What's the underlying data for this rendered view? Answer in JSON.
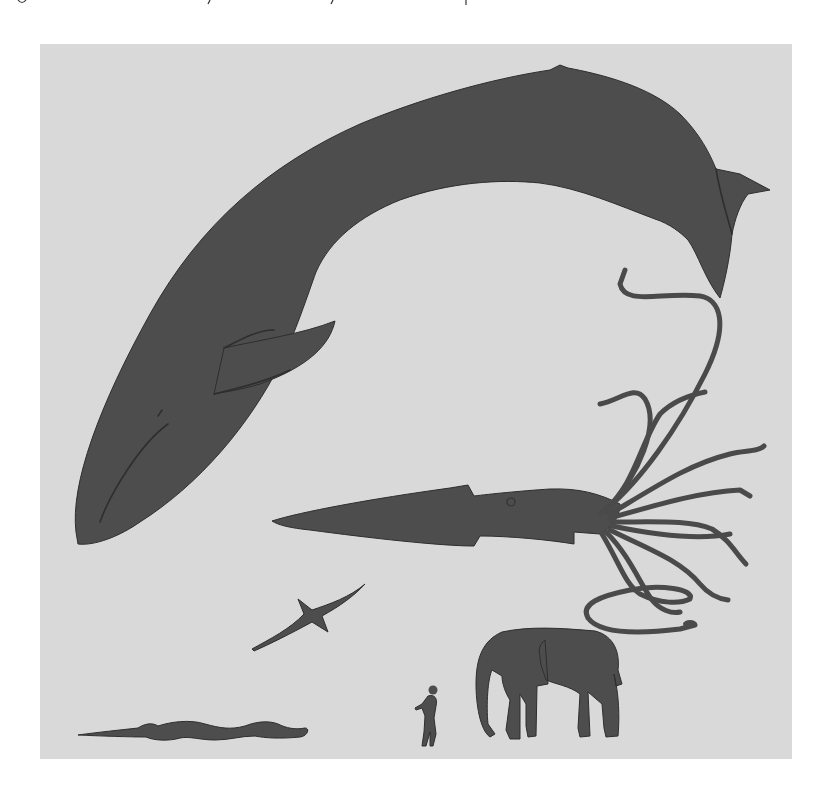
{
  "figure": {
    "background_color": "#d9d9d9",
    "silhouette_color": "#4d4d4d",
    "page_color": "#ffffff",
    "subjects": [
      {
        "id": "blue-whale",
        "label": "whale"
      },
      {
        "id": "giant-squid",
        "label": "squid"
      },
      {
        "id": "albatross",
        "label": "bird"
      },
      {
        "id": "snake",
        "label": "snake"
      },
      {
        "id": "human",
        "label": "human"
      },
      {
        "id": "elephant",
        "label": "elephant"
      }
    ]
  }
}
